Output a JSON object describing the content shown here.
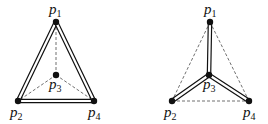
{
  "diagrams": [
    {
      "id": "left",
      "nodes": [
        {
          "name": "p",
          "sub": "1",
          "x": 56,
          "y": 22,
          "lx": 49,
          "ly": 14
        },
        {
          "name": "p",
          "sub": "2",
          "x": 18,
          "y": 101,
          "lx": 10,
          "ly": 117
        },
        {
          "name": "p",
          "sub": "3",
          "x": 56,
          "y": 75,
          "lx": 49,
          "ly": 89
        },
        {
          "name": "p",
          "sub": "4",
          "x": 94,
          "y": 101,
          "lx": 88,
          "ly": 117
        }
      ],
      "double_edges": [
        [
          "1",
          "2"
        ],
        [
          "1",
          "4"
        ],
        [
          "2",
          "4"
        ]
      ],
      "dashed_edges": [
        [
          "1",
          "3"
        ],
        [
          "3",
          "2"
        ],
        [
          "3",
          "4"
        ]
      ]
    },
    {
      "id": "right",
      "nodes": [
        {
          "name": "p",
          "sub": "1",
          "x": 210,
          "y": 22,
          "lx": 204,
          "ly": 14
        },
        {
          "name": "p",
          "sub": "2",
          "x": 172,
          "y": 101,
          "lx": 164,
          "ly": 117
        },
        {
          "name": "p",
          "sub": "3",
          "x": 209,
          "y": 75,
          "lx": 203,
          "ly": 89
        },
        {
          "name": "p",
          "sub": "4",
          "x": 249,
          "y": 101,
          "lx": 243,
          "ly": 117
        }
      ],
      "double_edges": [
        [
          "1",
          "3"
        ],
        [
          "3",
          "2"
        ],
        [
          "3",
          "4"
        ]
      ],
      "dashed_edges": [
        [
          "1",
          "2"
        ],
        [
          "1",
          "4"
        ],
        [
          "2",
          "4"
        ]
      ]
    }
  ],
  "style": {
    "stroke": "#111111",
    "dash": "3,2"
  }
}
